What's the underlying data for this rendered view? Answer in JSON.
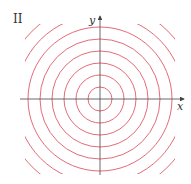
{
  "figure": {
    "panel_label": "II",
    "x_axis_label": "x",
    "y_axis_label": "y",
    "curve_color": "#e05a6a",
    "axis_color": "#444444",
    "center": [
      100,
      99
    ],
    "radii": [
      12,
      24,
      36,
      48,
      60,
      72,
      84,
      96
    ],
    "clip_region": {
      "x": 25,
      "y": 24,
      "width": 150,
      "height": 150
    }
  }
}
